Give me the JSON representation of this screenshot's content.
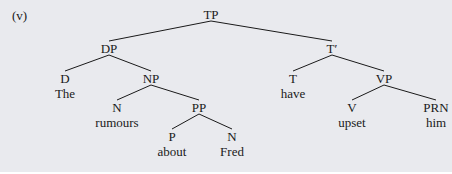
{
  "example_label": "(v)",
  "colors": {
    "background": "#e9eaee",
    "line": "#1a1a1a",
    "text": "#1a1a1a"
  },
  "tree": {
    "nodes": [
      {
        "id": "TP",
        "label": "TP",
        "x": 211,
        "y": 14
      },
      {
        "id": "DP",
        "label": "DP",
        "x": 109,
        "y": 48
      },
      {
        "id": "Tbar",
        "label": "T′",
        "x": 332,
        "y": 48
      },
      {
        "id": "D",
        "label": "D",
        "x": 65,
        "y": 78,
        "word": "The"
      },
      {
        "id": "NP",
        "label": "NP",
        "x": 151,
        "y": 78
      },
      {
        "id": "T",
        "label": "T",
        "x": 293,
        "y": 78,
        "word": "have"
      },
      {
        "id": "VP",
        "label": "VP",
        "x": 384,
        "y": 78
      },
      {
        "id": "N1",
        "label": "N",
        "x": 117,
        "y": 107,
        "word": "rumours"
      },
      {
        "id": "PP",
        "label": "PP",
        "x": 199,
        "y": 107
      },
      {
        "id": "V",
        "label": "V",
        "x": 352,
        "y": 107,
        "word": "upset"
      },
      {
        "id": "PRN",
        "label": "PRN",
        "x": 436,
        "y": 107,
        "word": "him"
      },
      {
        "id": "P",
        "label": "P",
        "x": 172,
        "y": 136,
        "word": "about"
      },
      {
        "id": "N2",
        "label": "N",
        "x": 232,
        "y": 136,
        "word": "Fred"
      }
    ],
    "edges": [
      [
        "TP",
        "DP"
      ],
      [
        "TP",
        "Tbar"
      ],
      [
        "DP",
        "D"
      ],
      [
        "DP",
        "NP"
      ],
      [
        "Tbar",
        "T"
      ],
      [
        "Tbar",
        "VP"
      ],
      [
        "NP",
        "N1"
      ],
      [
        "NP",
        "PP"
      ],
      [
        "VP",
        "V"
      ],
      [
        "VP",
        "PRN"
      ],
      [
        "PP",
        "P"
      ],
      [
        "PP",
        "N2"
      ]
    ]
  }
}
